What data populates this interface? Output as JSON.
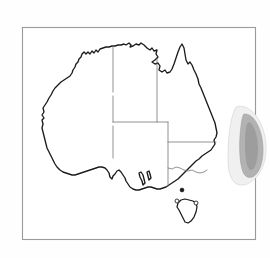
{
  "figure": {
    "kind": "map",
    "title": "",
    "caption": "",
    "region": "Australia",
    "background_color": "#fefefe"
  },
  "frame": {
    "visible": true,
    "stroke_color": "#9a9a9a",
    "x": 22,
    "y": 27,
    "width": 234,
    "height": 213
  },
  "map": {
    "outline_color": "#1b1b1b",
    "fill_color": "#ffffff",
    "border_color": "#6e6e6e",
    "mainland_label": "Australia mainland coastline",
    "island_label": "Tasmania"
  },
  "state_borders": [
    {
      "name": "wa-nt-sa-meridian",
      "label": "Western Australia eastern border"
    },
    {
      "name": "nt-sa-parallel",
      "label": "Northern Territory / South Australia border"
    },
    {
      "name": "nt-qld-meridian",
      "label": "Northern Territory / Queensland border"
    },
    {
      "name": "sa-qld-nsw-meridian",
      "label": "South Australia eastern border"
    },
    {
      "name": "nsw-vic-murray",
      "label": "New South Wales / Victoria border"
    },
    {
      "name": "qld-nsw-parallel",
      "label": "Queensland / New South Wales border"
    }
  ],
  "markers": [
    {
      "name": "marker-filled-south-coast",
      "style": "filled",
      "cx": 182,
      "cy": 190
    },
    {
      "name": "marker-open-west-tasmania",
      "style": "open",
      "cx": 177,
      "cy": 201
    },
    {
      "name": "marker-open-east-tasmania",
      "style": "open",
      "cx": 196,
      "cy": 203
    }
  ],
  "overlay_blob": {
    "name": "grey-shaded-region",
    "label": "Shaded region at eastern edge",
    "outer_color": "#f0f0f0",
    "inner_color": "#a8a8a8",
    "clipped": true,
    "position": "right edge"
  },
  "legend": {
    "visible": false,
    "entries": []
  },
  "annotations": []
}
